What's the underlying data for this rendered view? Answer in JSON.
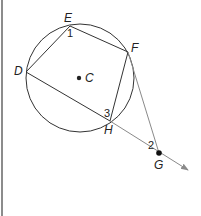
{
  "diagram": {
    "type": "circle-geometry",
    "circle": {
      "center_label": "C",
      "cx": 80,
      "cy": 78,
      "r": 54
    },
    "points": {
      "E": {
        "label": "E",
        "x": 70,
        "y": 26
      },
      "F": {
        "label": "F",
        "x": 128,
        "y": 52
      },
      "D": {
        "label": "D",
        "x": 26,
        "y": 72
      },
      "H": {
        "label": "H",
        "x": 110,
        "y": 121
      },
      "G": {
        "label": "G",
        "x": 159,
        "y": 153
      }
    },
    "angles": {
      "a1": "1",
      "a2": "2",
      "a3": "3"
    },
    "colors": {
      "line": "#333333",
      "secant": "#8a8a8a",
      "bar": "#8c8c8c"
    }
  }
}
